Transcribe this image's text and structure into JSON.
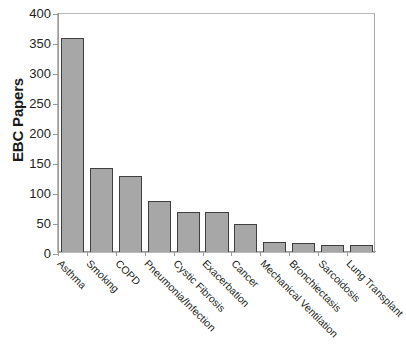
{
  "chart_data": {
    "type": "bar",
    "title": "",
    "xlabel": "",
    "ylabel": "EBC Papers",
    "ylim": [
      0,
      400
    ],
    "yticks": [
      0,
      50,
      100,
      150,
      200,
      250,
      300,
      350,
      400
    ],
    "ytick_labels": [
      "0",
      "50",
      "100",
      "150",
      "200",
      "250",
      "300",
      "350",
      "400"
    ],
    "grid": false,
    "legend": null,
    "orientation": "vertical",
    "bar_color": "#A7A7A7",
    "bar_edge_color": "#3F3F3F",
    "categories": [
      "Asthma",
      "Smoking",
      "COPD",
      "Pneumonia/Infection",
      "Cystic Fibrosis",
      "Exacerbation",
      "Cancer",
      "Mechanical Ventilation",
      "Bronchiectasis",
      "Sarcoidosis",
      "Lung Transplant"
    ],
    "values": [
      357,
      140,
      127,
      85,
      66,
      67,
      47,
      17,
      15,
      12,
      11
    ]
  },
  "axis": {
    "y_title": "EBC Papers"
  }
}
